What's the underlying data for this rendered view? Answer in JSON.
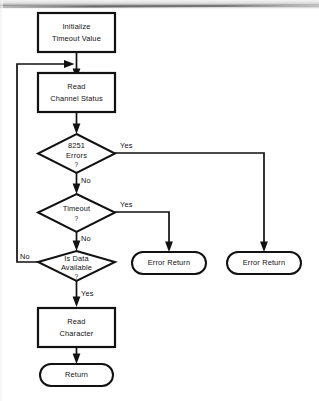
{
  "diagram": {
    "type": "flowchart",
    "nodes": [
      {
        "id": "initialize",
        "shape": "process",
        "lines": [
          "Initialize",
          "Timeout Value"
        ]
      },
      {
        "id": "read-channel-status",
        "shape": "process",
        "lines": [
          "Read",
          "Channel Status"
        ]
      },
      {
        "id": "errors-8251",
        "shape": "decision",
        "lines": [
          "8251",
          "Errors",
          "?"
        ]
      },
      {
        "id": "timeout",
        "shape": "decision",
        "lines": [
          "Timeout",
          "?"
        ]
      },
      {
        "id": "is-data-available",
        "shape": "decision",
        "lines": [
          "Is Data",
          "Available",
          "?"
        ]
      },
      {
        "id": "read-character",
        "shape": "process",
        "lines": [
          "Read",
          "Character"
        ]
      },
      {
        "id": "error-return-timeout",
        "shape": "terminator",
        "lines": [
          "Error Return"
        ]
      },
      {
        "id": "error-return-8251",
        "shape": "terminator",
        "lines": [
          "Error Return"
        ]
      },
      {
        "id": "return",
        "shape": "terminator",
        "lines": [
          "Return"
        ]
      }
    ],
    "edge_labels": {
      "errors_yes": "Yes",
      "errors_no": "No",
      "timeout_yes": "Yes",
      "timeout_no": "No",
      "data_no": "No",
      "data_yes": "Yes"
    },
    "colors": {
      "stroke": "#111111",
      "fill": "#ffffff",
      "background": "#ffffff"
    }
  }
}
